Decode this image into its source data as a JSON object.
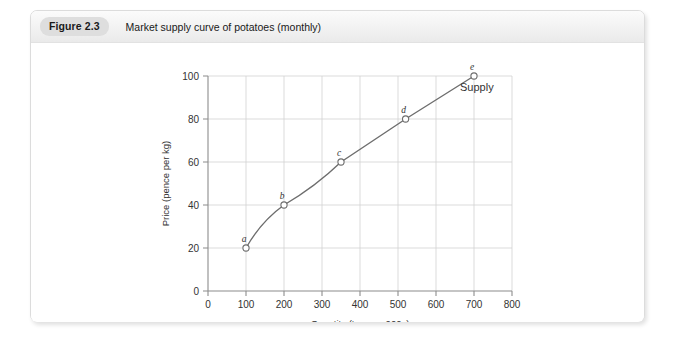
{
  "figure": {
    "badge": "Figure 2.3",
    "caption": "Market supply curve of potatoes (monthly)"
  },
  "chart_data": {
    "type": "line",
    "title": "Market supply curve of potatoes (monthly)",
    "xlabel": "Quantity (tonnes: 000s)",
    "ylabel": "Price (pence per kg)",
    "xlim": [
      0,
      800
    ],
    "ylim": [
      0,
      100
    ],
    "xticks": [
      0,
      100,
      200,
      300,
      400,
      500,
      600,
      700,
      800
    ],
    "xtick_labels": [
      "0",
      "100",
      "200",
      "300",
      "400",
      "500",
      "600",
      "700",
      "800"
    ],
    "yticks": [
      0,
      20,
      40,
      60,
      80,
      100
    ],
    "ytick_labels": [
      "0",
      "20",
      "40",
      "60",
      "80",
      "100"
    ],
    "grid": true,
    "legend_position": "inline-right",
    "series": [
      {
        "name": "Supply",
        "x": [
          100,
          200,
          350,
          520,
          700
        ],
        "y": [
          20,
          40,
          60,
          80,
          100
        ],
        "point_labels": [
          "a",
          "b",
          "c",
          "d",
          "e"
        ],
        "color": "#6e6e6e"
      }
    ],
    "annotations": [
      {
        "text": "Supply",
        "x": 700,
        "y": 93
      }
    ]
  }
}
